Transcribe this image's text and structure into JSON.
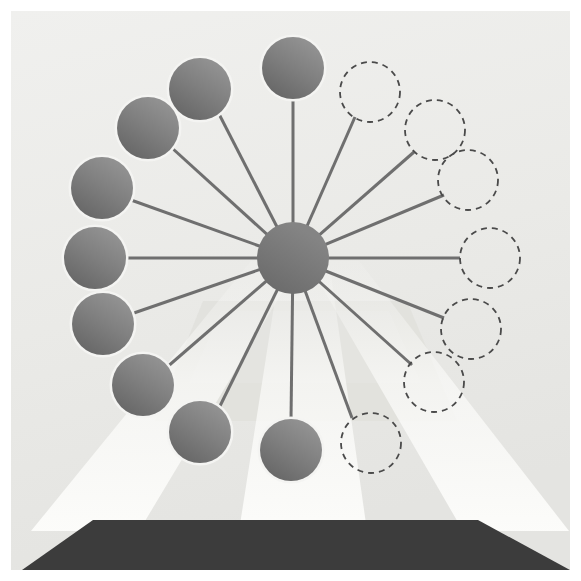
{
  "figure": {
    "canvas": {
      "width": 581,
      "height": 581
    },
    "panel": {
      "x": 11,
      "y": 11,
      "width": 559,
      "height": 559
    }
  },
  "colors": {
    "page_background": "#ffffff",
    "panel_background_top": "#eeeeec",
    "panel_background_bottom": "#e6e6e3",
    "hub_fill": "#7b7b7b",
    "spoke_stroke": "#6f6f6f",
    "cabin_fill_light": "#8c8c8c",
    "cabin_fill_dark": "#6e6e6e",
    "cabin_outline": "#f4f4f2",
    "ghost_stroke": "#4a4a4a",
    "base_fill": "#3c3c3c",
    "beam_fill": "#f7f7f5",
    "floor_fill": "#e2e2df"
  },
  "hub": {
    "label": "wheel-hub",
    "cx": 293,
    "cy": 258,
    "r": 36
  },
  "geometry": {
    "spoke_count": 14,
    "spoke_radius": 170,
    "cabin_radius": 31,
    "ghost_radius": 30,
    "spoke_width": 3,
    "angle_step_deg": 25.7
  },
  "chart_data": {
    "type": "scatter",
    "xlabel": "",
    "ylabel": "",
    "legend": [
      {
        "name": "occupied-cabin",
        "style": "solid-filled-circle",
        "count": 9
      },
      {
        "name": "empty-cabin-slot",
        "style": "dashed-outline-circle",
        "count": 5
      }
    ],
    "nodes": [
      {
        "id": "cabin-01",
        "state": "solid",
        "angle_deg": 90,
        "cx": 293,
        "cy": 68,
        "r": 31
      },
      {
        "id": "cabin-02",
        "state": "solid",
        "angle_deg": 115.7,
        "cx": 200,
        "cy": 89,
        "r": 31
      },
      {
        "id": "cabin-03",
        "state": "solid",
        "angle_deg": 141.4,
        "cx": 148,
        "cy": 128,
        "r": 31
      },
      {
        "id": "cabin-04",
        "state": "solid",
        "angle_deg": 167.1,
        "cx": 102,
        "cy": 188,
        "r": 31
      },
      {
        "id": "cabin-05",
        "state": "solid",
        "angle_deg": 180,
        "cx": 95,
        "cy": 258,
        "r": 31
      },
      {
        "id": "cabin-06",
        "state": "solid",
        "angle_deg": 205.7,
        "cx": 103,
        "cy": 324,
        "r": 31
      },
      {
        "id": "cabin-07",
        "state": "solid",
        "angle_deg": 231.4,
        "cx": 143,
        "cy": 385,
        "r": 31
      },
      {
        "id": "cabin-08",
        "state": "solid",
        "angle_deg": 257.1,
        "cx": 200,
        "cy": 432,
        "r": 31
      },
      {
        "id": "cabin-09",
        "state": "solid",
        "angle_deg": 270,
        "cx": 291,
        "cy": 450,
        "r": 31
      },
      {
        "id": "slot-10",
        "state": "dashed",
        "angle_deg": 295.7,
        "cx": 371,
        "cy": 443,
        "r": 30
      },
      {
        "id": "slot-11",
        "state": "dashed",
        "angle_deg": 321.4,
        "cx": 434,
        "cy": 382,
        "r": 30
      },
      {
        "id": "slot-12",
        "state": "dashed",
        "angle_deg": 347.1,
        "cx": 471,
        "cy": 329,
        "r": 30
      },
      {
        "id": "slot-13",
        "state": "dashed",
        "angle_deg": 0,
        "cx": 490,
        "cy": 258,
        "r": 30
      },
      {
        "id": "slot-14",
        "state": "dashed",
        "angle_deg": 25.7,
        "cx": 468,
        "cy": 180,
        "r": 30
      },
      {
        "id": "slot-15",
        "state": "dashed",
        "angle_deg": 51.4,
        "cx": 435,
        "cy": 130,
        "r": 30
      },
      {
        "id": "slot-16",
        "state": "dashed",
        "angle_deg": 64,
        "cx": 370,
        "cy": 92,
        "r": 30
      }
    ],
    "spokes": [
      {
        "id": "spoke-01",
        "to": "cabin-01",
        "x2": 293,
        "y2": 99
      },
      {
        "id": "spoke-02",
        "to": "cabin-02",
        "x2": 219,
        "y2": 114
      },
      {
        "id": "spoke-03",
        "to": "cabin-03",
        "x2": 172,
        "y2": 148
      },
      {
        "id": "spoke-04",
        "to": "cabin-04",
        "x2": 131,
        "y2": 200
      },
      {
        "id": "spoke-05",
        "to": "cabin-05",
        "x2": 126,
        "y2": 258
      },
      {
        "id": "spoke-06",
        "to": "cabin-06",
        "x2": 131,
        "y2": 314
      },
      {
        "id": "spoke-07",
        "to": "cabin-07",
        "x2": 166,
        "y2": 368
      },
      {
        "id": "spoke-08",
        "to": "cabin-08",
        "x2": 219,
        "y2": 408
      },
      {
        "id": "spoke-09",
        "to": "cabin-09",
        "x2": 291,
        "y2": 419
      },
      {
        "id": "spoke-10",
        "to": "slot-10",
        "x2": 352,
        "y2": 418
      },
      {
        "id": "spoke-11",
        "to": "slot-11",
        "x2": 412,
        "y2": 365
      },
      {
        "id": "spoke-12",
        "to": "slot-12",
        "x2": 444,
        "y2": 318
      },
      {
        "id": "spoke-13",
        "to": "slot-13",
        "x2": 460,
        "y2": 258
      },
      {
        "id": "spoke-14",
        "to": "slot-14",
        "x2": 444,
        "y2": 195
      },
      {
        "id": "spoke-15",
        "to": "slot-15",
        "x2": 414,
        "y2": 152
      },
      {
        "id": "spoke-16",
        "to": "slot-16",
        "x2": 355,
        "y2": 117
      }
    ]
  },
  "scene": {
    "base_platform": {
      "label": "base-platform",
      "points": "22,570 93,520 478,520 570,570"
    },
    "light_beams": [
      {
        "id": "beam-left",
        "points": "236,258 293,258 133,520 27,520"
      },
      {
        "id": "beam-center",
        "points": "272,258 316,258 352,520 232,520"
      },
      {
        "id": "beam-right",
        "points": "293,258 350,258 556,520 450,520"
      }
    ],
    "floor_panel": {
      "label": "floor-shadow-panel",
      "points": "192,300 396,300 436,400 154,400"
    }
  }
}
